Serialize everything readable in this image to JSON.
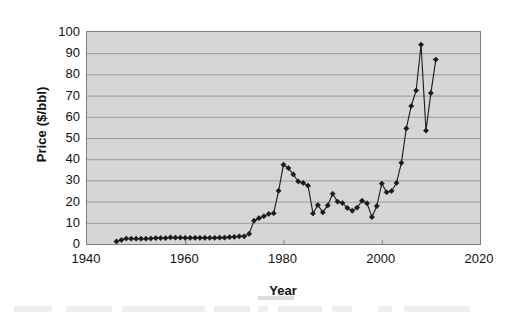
{
  "chart_data": {
    "type": "line",
    "title": "",
    "subtitle": "",
    "xlabel": "Year",
    "ylabel": "Price ($/bbl)",
    "xlim": [
      1940,
      2020
    ],
    "ylim": [
      0,
      100
    ],
    "xticks": [
      1940,
      1960,
      1980,
      2000,
      2020
    ],
    "xtick_labels": [
      "1940",
      "1960",
      "1980",
      "2000",
      "2020"
    ],
    "yticks": [
      0,
      10,
      20,
      30,
      40,
      50,
      60,
      70,
      80,
      90,
      100
    ],
    "ytick_labels": [
      "0",
      "10",
      "20",
      "30",
      "40",
      "50",
      "60",
      "70",
      "80",
      "90",
      "100"
    ],
    "grid": "horizontal",
    "legend": "none",
    "plot_background": "#d6d6d6",
    "line_color": "#1a1a1a",
    "marker": "diamond",
    "marker_color": "#1a1a1a",
    "series": [
      {
        "name": "Crude oil price",
        "x": [
          1946,
          1947,
          1948,
          1949,
          1950,
          1951,
          1952,
          1953,
          1954,
          1955,
          1956,
          1957,
          1958,
          1959,
          1960,
          1961,
          1962,
          1963,
          1964,
          1965,
          1966,
          1967,
          1968,
          1969,
          1970,
          1971,
          1972,
          1973,
          1974,
          1975,
          1976,
          1977,
          1978,
          1979,
          1980,
          1981,
          1982,
          1983,
          1984,
          1985,
          1986,
          1987,
          1988,
          1989,
          1990,
          1991,
          1992,
          1993,
          1994,
          1995,
          1996,
          1997,
          1998,
          1999,
          2000,
          2001,
          2002,
          2003,
          2004,
          2005,
          2006,
          2007,
          2008,
          2009,
          2010,
          2011
        ],
        "y": [
          1.2,
          1.9,
          2.6,
          2.5,
          2.5,
          2.5,
          2.5,
          2.6,
          2.8,
          2.8,
          2.8,
          3.1,
          3.0,
          3.0,
          2.9,
          2.9,
          2.9,
          2.9,
          2.9,
          2.9,
          2.9,
          3.0,
          3.0,
          3.2,
          3.4,
          3.6,
          3.6,
          4.8,
          11.0,
          12.2,
          13.1,
          14.2,
          14.5,
          25.1,
          37.4,
          35.8,
          32.8,
          29.5,
          28.8,
          27.5,
          14.4,
          18.4,
          14.9,
          18.2,
          23.7,
          20.0,
          19.3,
          17.0,
          15.7,
          17.2,
          20.4,
          19.2,
          12.7,
          17.9,
          28.5,
          24.4,
          25.0,
          28.8,
          38.3,
          54.5,
          65.1,
          72.4,
          94.0,
          53.5,
          71.2,
          87.0
        ]
      }
    ],
    "annotations": []
  }
}
